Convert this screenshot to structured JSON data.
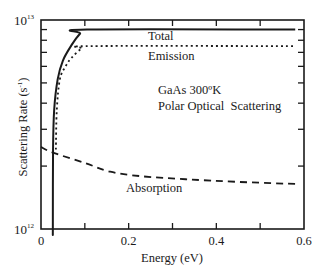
{
  "chart_data": {
    "type": "line",
    "title": "",
    "xlabel": "Energy (eV)",
    "ylabel": "Scattering Rate (s^-1)",
    "ylabel_parts": {
      "main": "Scattering Rate (s",
      "sup": "-1",
      "close": ")"
    },
    "xlim": [
      0,
      0.6
    ],
    "ylim": [
      1000000000000.0,
      10000000000000.0
    ],
    "yscale": "log",
    "grid": false,
    "legend": "none (inline curve labels)",
    "x_ticks": [
      0,
      0.1,
      0.2,
      0.3,
      0.4,
      0.5,
      0.6
    ],
    "x_tick_labels": [
      {
        "value": 0,
        "label": "0"
      },
      {
        "value": 0.2,
        "label": "0.2"
      },
      {
        "value": 0.4,
        "label": "0.4"
      },
      {
        "value": 0.6,
        "label": "0.6"
      }
    ],
    "y_ticks": [
      1000000000000.0,
      2000000000000.0,
      3000000000000.0,
      4000000000000.0,
      5000000000000.0,
      6000000000000.0,
      7000000000000.0,
      8000000000000.0,
      9000000000000.0,
      10000000000000.0
    ],
    "y_tick_labels": [
      {
        "value": 1000000000000.0,
        "base": "10",
        "exp": "12"
      },
      {
        "value": 10000000000000.0,
        "base": "10",
        "exp": "13"
      }
    ],
    "annotations": [
      {
        "text": "Total",
        "x": 0.245,
        "y": 8500000000000.0
      },
      {
        "text": "Emission",
        "x": 0.245,
        "y": 6600000000000.0
      },
      {
        "text": "GaAs 300ºK",
        "x": 0.27,
        "y": 4350000000000.0
      },
      {
        "text": "Polar Optical  Scattering",
        "x": 0.27,
        "y": 3650000000000.0
      },
      {
        "text": "Absorption",
        "x": 0.23,
        "y": 1450000000000.0
      }
    ],
    "series": [
      {
        "name": "Total",
        "style": "solid",
        "x": [
          0.027,
          0.0275,
          0.03,
          0.038,
          0.05,
          0.07,
          0.089,
          0.105,
          0.58
        ],
        "y": [
          1000000000000.0,
          2400000000000.0,
          3700000000000.0,
          5200000000000.0,
          6400000000000.0,
          7600000000000.0,
          8600000000000.0,
          9000000000000.0,
          9000000000000.0
        ]
      },
      {
        "name": "Emission",
        "style": "dotted",
        "x": [
          0.034,
          0.036,
          0.043,
          0.056,
          0.07,
          0.093,
          0.115,
          0.58
        ],
        "y": [
          2400000000000.0,
          3700000000000.0,
          5200000000000.0,
          6000000000000.0,
          6600000000000.0,
          7300000000000.0,
          7500000000000.0,
          7500000000000.0
        ]
      },
      {
        "name": "Absorption",
        "style": "dashed",
        "x": [
          0.0,
          0.027,
          0.1,
          0.158,
          0.227,
          0.33,
          0.45,
          0.59
        ],
        "y": [
          2470000000000.0,
          2320000000000.0,
          2070000000000.0,
          1880000000000.0,
          1790000000000.0,
          1730000000000.0,
          1680000000000.0,
          1640000000000.0
        ]
      }
    ]
  }
}
